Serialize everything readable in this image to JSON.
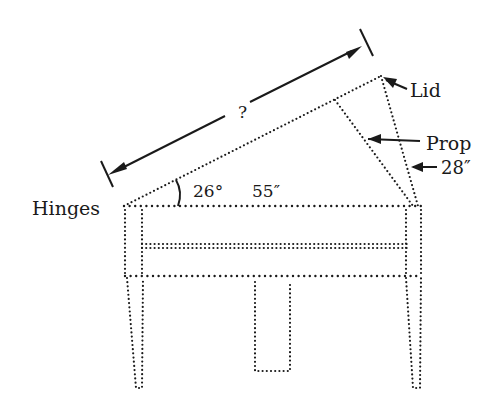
{
  "diagram": {
    "labels": {
      "hinges": "Hinges",
      "lid": "Lid",
      "prop": "Prop",
      "prop_length": "28″",
      "angle": "26°",
      "base_length": "55″",
      "unknown_length": "?"
    },
    "measurements": {
      "angle_deg": 26,
      "base_inches": 55,
      "prop_inches": 28,
      "lid_length": "?"
    },
    "colors": {
      "ink": "#1a1a1a",
      "background": "#ffffff"
    }
  }
}
